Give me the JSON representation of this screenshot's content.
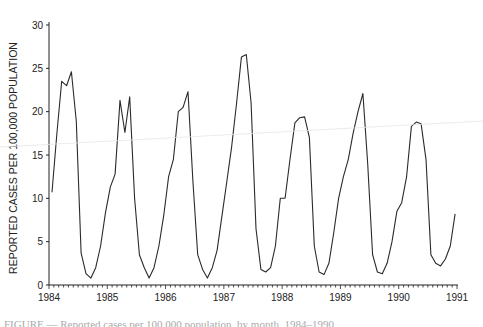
{
  "chart_data": {
    "type": "line",
    "title": "",
    "xlabel": "",
    "ylabel": "REPORTED CASES PER 100,000 POPULATION",
    "xlim": [
      1984,
      1991
    ],
    "ylim": [
      0,
      30
    ],
    "x_ticks": [
      "1984",
      "1985",
      "1986",
      "1987",
      "1988",
      "1989",
      "1990",
      "1991"
    ],
    "y_ticks": [
      "0",
      "5",
      "10",
      "15",
      "20",
      "25",
      "30"
    ],
    "x_minor_ticks_per_year": 12,
    "grid": false,
    "legend": null,
    "x_unit": "monthly, starting Jan 1984",
    "series": [
      {
        "name": "Reported cases per 100,000",
        "values": [
          10.7,
          17.5,
          23.5,
          23.0,
          24.6,
          18.9,
          3.7,
          1.3,
          0.8,
          2.0,
          4.5,
          8.3,
          11.3,
          12.8,
          21.3,
          17.6,
          21.7,
          10.0,
          3.5,
          2.0,
          0.8,
          2.0,
          4.5,
          8.0,
          12.5,
          14.5,
          20.0,
          20.5,
          22.3,
          12.0,
          3.5,
          1.8,
          0.8,
          2.0,
          4.0,
          8.0,
          12.0,
          16.0,
          21.0,
          26.3,
          26.6,
          21.0,
          6.5,
          1.8,
          1.5,
          2.0,
          4.5,
          10.0,
          10.0,
          14.5,
          18.7,
          19.3,
          19.4,
          17.0,
          4.5,
          1.5,
          1.2,
          2.5,
          6.0,
          10.0,
          12.5,
          14.5,
          17.5,
          20.0,
          22.1,
          14.0,
          3.5,
          1.5,
          1.3,
          2.5,
          5.0,
          8.5,
          9.5,
          12.5,
          18.3,
          18.8,
          18.6,
          14.5,
          3.5,
          2.5,
          2.2,
          3.0,
          4.5,
          8.2
        ]
      }
    ]
  },
  "caption": {
    "text": "FIGURE — Reported cases per 100,000 population, by month, 1984–1990"
  }
}
